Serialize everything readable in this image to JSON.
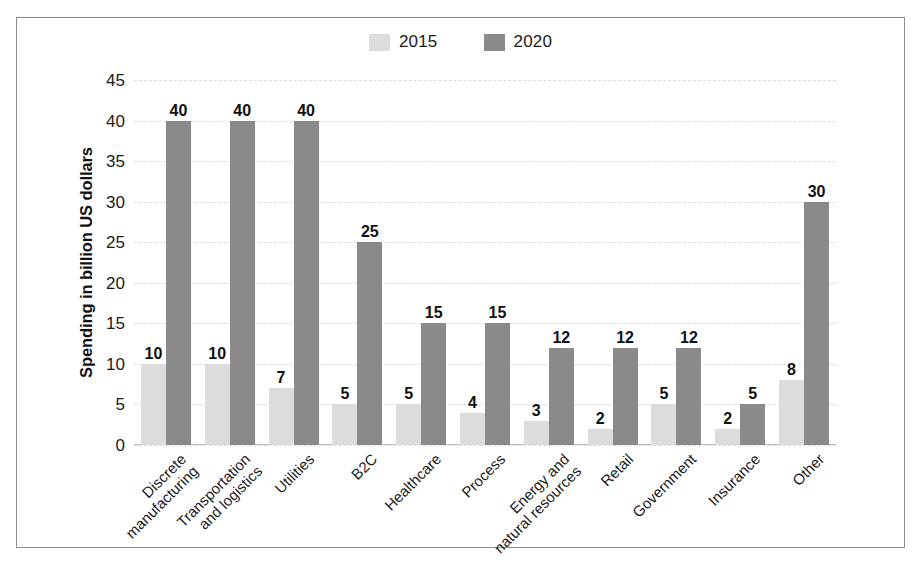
{
  "figure": {
    "border_color": "#8d8d8d",
    "background": "#ffffff"
  },
  "legend": {
    "position": "top-center",
    "entries": [
      {
        "label": "2015",
        "color": "#dcdcdc",
        "swatch_name": "legend-swatch-2015"
      },
      {
        "label": "2020",
        "color": "#8a8a8a",
        "swatch_name": "legend-swatch-2020"
      }
    ]
  },
  "chart_data": {
    "type": "bar",
    "title": "",
    "subtitle": "",
    "xlabel": "",
    "ylabel": "Spending in billion US dollars",
    "ylim": [
      0,
      45
    ],
    "ytick_step": 5,
    "ytick_labels": [
      "45",
      "40",
      "35",
      "30",
      "25",
      "20",
      "15",
      "10",
      "5",
      "0"
    ],
    "grid": true,
    "grid_axis": "y",
    "legend_position": "top-center",
    "categories": [
      "Discrete manufacturing",
      "Transportation and logistics",
      "Utilities",
      "B2C",
      "Healthcare",
      "Process",
      "Energy and natural resources",
      "Retail",
      "Government",
      "Insurance",
      "Other"
    ],
    "category_lines": [
      [
        "Discrete",
        "manufacturing"
      ],
      [
        "Transportation",
        "and logistics"
      ],
      [
        "Utilities",
        ""
      ],
      [
        "B2C",
        ""
      ],
      [
        "Healthcare",
        ""
      ],
      [
        "Process",
        ""
      ],
      [
        "Energy and",
        "natural resources"
      ],
      [
        "Retail",
        ""
      ],
      [
        "Government",
        ""
      ],
      [
        "Insurance",
        ""
      ],
      [
        "Other",
        ""
      ]
    ],
    "series": [
      {
        "name": "2015",
        "color": "#dcdcdc",
        "values": [
          10,
          10,
          7,
          5,
          5,
          4,
          3,
          2,
          5,
          2,
          8
        ],
        "labels": [
          "10",
          "10",
          "7",
          "5",
          "5",
          "4",
          "3",
          "2",
          "5",
          "2",
          "8"
        ]
      },
      {
        "name": "2020",
        "color": "#8a8a8a",
        "values": [
          40,
          40,
          40,
          25,
          15,
          15,
          12,
          12,
          12,
          5,
          30
        ],
        "labels": [
          "40",
          "40",
          "40",
          "25",
          "15",
          "15",
          "12",
          "12",
          "12",
          "5",
          "30"
        ]
      }
    ]
  }
}
